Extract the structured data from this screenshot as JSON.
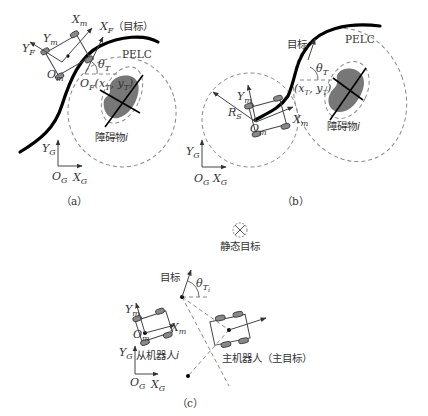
{
  "panel_a": {
    "caption": "（a）",
    "labels": {
      "xm": "X",
      "xm_sub": "m",
      "xf": "X",
      "xf_sub": "F",
      "xf_note": "（目标）",
      "ym": "Y",
      "ym_sub": "m",
      "yf": "Y",
      "yf_sub": "F",
      "om": "O",
      "om_sub": "m",
      "theta": "θ",
      "theta_sub": "T",
      "of": "O",
      "of_sub": "F",
      "of_coord": "(x",
      "of_coord2": "T",
      "of_coord3": ", y",
      "of_coord4": "T",
      "of_coord5": ")",
      "pelc": "PELC",
      "obstacle": "障碍物",
      "obstacle_i": "i",
      "yg": "Y",
      "yg_sub": "G",
      "og": "O",
      "og_sub": "G",
      "xg": "X",
      "xg_sub": "G"
    }
  },
  "panel_b": {
    "caption": "（b）",
    "labels": {
      "target": "目标",
      "pelc": "PELC",
      "theta": "θ",
      "theta_sub": "T",
      "coord": "(x",
      "coord_sub1": "T",
      "coord_mid": ", y",
      "coord_sub2": "T",
      "coord_end": ")",
      "rs": "R",
      "rs_sub": "S",
      "ym": "Y",
      "ym_sub": "m",
      "xm": "X",
      "xm_sub": "m",
      "om": "O",
      "om_sub": "m",
      "obstacle": "障碍物",
      "obstacle_i": "i",
      "yg": "Y",
      "yg_sub": "G",
      "og": "O",
      "og_sub": "G",
      "xg": "X",
      "xg_sub": "G"
    }
  },
  "panel_c": {
    "caption": "（c）",
    "labels": {
      "static_target": "静态目标",
      "target": "目标",
      "theta": "θ",
      "theta_sub": "T",
      "theta_subsub": "i",
      "ym": "Y",
      "ym_sub": "m",
      "xm": "X",
      "xm_sub": "m",
      "om": "O",
      "om_sub": "m",
      "follower": "从机器人",
      "follower_i": "i",
      "leader": "主机器人（主目标）",
      "yg": "Y",
      "yg_sub": "G",
      "og": "O",
      "og_sub": "G",
      "xg": "X",
      "xg_sub": "G"
    }
  }
}
